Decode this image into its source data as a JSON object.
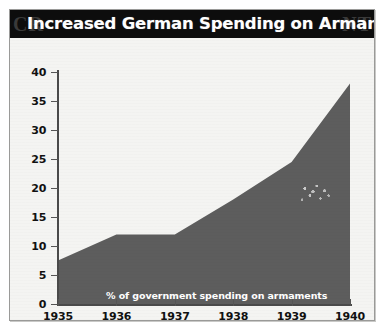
{
  "figure": {
    "title": "Increased German Spending on Armaments",
    "watermark_left": "CR",
    "watermark_right": "NT",
    "background_color": "#f4f4f2",
    "title_bar_color": "#0d0d0d",
    "title_text_color": "#ffffff",
    "frame_color": "#9a9a98"
  },
  "chart_data": {
    "type": "area",
    "title": "Increased German Spending on Armaments",
    "xlabel": "",
    "ylabel": "",
    "series_label": "% of government spending on armaments",
    "categories": [
      "1935",
      "1936",
      "1937",
      "1938",
      "1939",
      "1940"
    ],
    "x": [
      1935,
      1936,
      1937,
      1938,
      1939,
      1940
    ],
    "values": [
      7.5,
      12,
      12,
      18,
      24.5,
      38
    ],
    "series": [
      {
        "name": "% of government spending on armaments",
        "values": [
          7.5,
          12,
          12,
          18,
          24.5,
          38
        ],
        "color": "#5d5d5d"
      }
    ],
    "ylim": [
      0,
      40
    ],
    "xlim": [
      1935,
      1940
    ],
    "ytick_values": [
      0,
      5,
      10,
      15,
      20,
      25,
      30,
      35,
      40
    ],
    "ytick_labels": [
      "0",
      "5",
      "10",
      "15",
      "20",
      "25",
      "30",
      "35",
      "40"
    ],
    "xtick_labels": [
      "1935",
      "1936",
      "1937",
      "1938",
      "1939",
      "1940"
    ],
    "grid": false,
    "legend_position": "inside-bottom-left",
    "area_color": "#5d5d5d",
    "axis_color": "#4a4a4a"
  }
}
